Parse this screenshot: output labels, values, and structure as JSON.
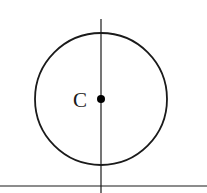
{
  "diagram": {
    "center_label": "C",
    "circle": {
      "cx": 101,
      "cy": 99,
      "r": 66
    },
    "vertical_line": {
      "x": 101,
      "y1": 19,
      "y2": 193
    },
    "horizontal_line": {
      "y": 186,
      "x1": 0,
      "x2": 207
    },
    "stroke_color": "#1a1a1a"
  }
}
